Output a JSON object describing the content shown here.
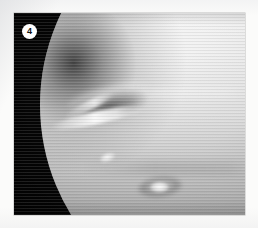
{
  "figure": {
    "badge_label": "4",
    "badge_shape": "circle",
    "badge_text_color": "#101010",
    "badge_fill_color": "#ffffff"
  },
  "photo": {
    "subject": "planet-disk",
    "description": "Grayscale spacecraft image of a gas-giant planet; dark night side at left, illuminated disk filling the frame",
    "medium": "raster-scanline-halftone",
    "colors": {
      "space_black": "#070707",
      "disk_highlight": "#f7f7f7",
      "disk_midtone": "#b4b4b4",
      "disk_shadow": "#2e2e2e"
    },
    "features": [
      {
        "name": "great-dark-spot",
        "kind": "dark-oval"
      },
      {
        "name": "bright-cirrus-streak",
        "kind": "bright-streak"
      },
      {
        "name": "small-bright-cloud",
        "kind": "bright-spot"
      },
      {
        "name": "southern-bright-spot",
        "kind": "bright-oval"
      },
      {
        "name": "faint-cloud-band",
        "kind": "band"
      }
    ]
  },
  "page": {
    "background_color": "#fbfbfa"
  }
}
